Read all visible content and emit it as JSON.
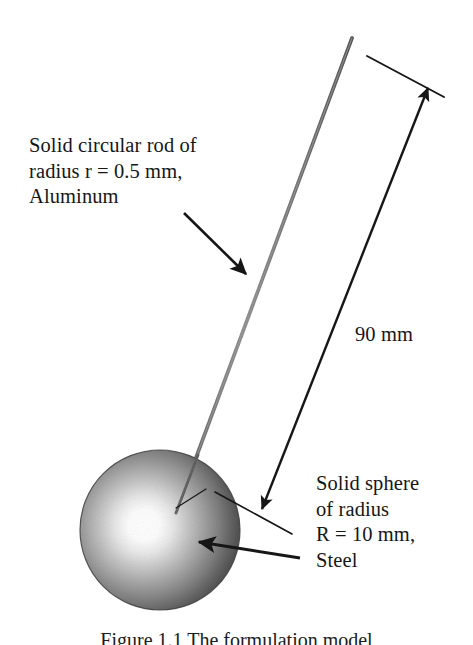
{
  "figure": {
    "background_color": "#ffffff",
    "ink_color": "#161616",
    "rod_color": "#8a8a8a",
    "sphere_edge_color": "#4a4a4a",
    "sphere_highlight_color": "#ffffff"
  },
  "labels": {
    "rod": "Solid circular rod of\nradius r = 0.5 mm,\nAluminum",
    "rod_line1": "Solid circular rod of",
    "rod_line2": "radius r = 0.5 mm,",
    "rod_line3": "Aluminum",
    "dimension": "90 mm",
    "sphere": "Solid sphere\nof radius\nR = 10 mm,\nSteel",
    "sphere_line1": "Solid sphere",
    "sphere_line2": "of radius",
    "sphere_line3": "R = 10 mm,",
    "sphere_line4": "Steel"
  },
  "caption": {
    "text": "Figure 1.1 The formulation model"
  },
  "measurements": {
    "rod_radius": "r = 0.5 mm",
    "rod_material": "Aluminum",
    "sphere_radius": "R = 10 mm",
    "sphere_material": "Steel",
    "length": "90 mm"
  },
  "geometry": {
    "rod_top": {
      "x": 352,
      "y": 38
    },
    "rod_bottom": {
      "x": 180,
      "y": 500
    },
    "sphere_center": {
      "x": 160,
      "y": 530
    },
    "sphere_radius_px": 80,
    "dimension_line_top": {
      "x": 428,
      "y": 88
    },
    "dimension_line_bottom": {
      "x": 262,
      "y": 509
    },
    "extension_line_start": {
      "x": 367,
      "y": 56
    },
    "extension_line_end": {
      "x": 444,
      "y": 97
    }
  }
}
